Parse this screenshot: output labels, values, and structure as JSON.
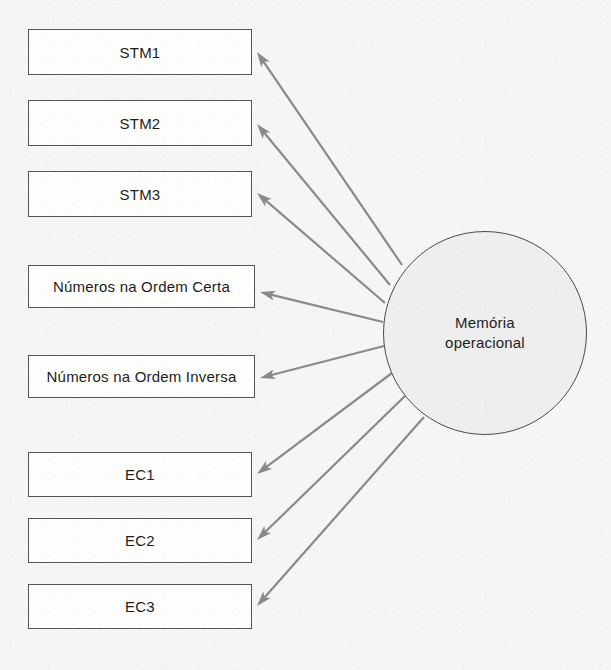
{
  "diagram": {
    "background_color": "#f5f5f4",
    "edge_color": "#8a8a8a",
    "box_border_color": "#545454",
    "box_fill_color": "#fdfdfc",
    "circle_fill_color": "#eeeeee",
    "circle_border_color": "#4a4a4a",
    "text_color": "#1d1d1d"
  },
  "latent": {
    "name": "memoria-operacional",
    "label": "Memória\noperacional",
    "line1": "Memória",
    "line2": "operacional",
    "shape": "circle",
    "cx": 485,
    "cy": 333,
    "r": 102
  },
  "indicators": [
    {
      "id": "stm1",
      "label": "STM1",
      "x": 28,
      "y": 29,
      "w": 224,
      "h": 46
    },
    {
      "id": "stm2",
      "label": "STM2",
      "x": 28,
      "y": 100,
      "w": 224,
      "h": 46
    },
    {
      "id": "stm3",
      "label": "STM3",
      "x": 28,
      "y": 171,
      "w": 224,
      "h": 46
    },
    {
      "id": "ordem-certa",
      "label": "Números na Ordem Certa",
      "x": 28,
      "y": 265,
      "w": 227,
      "h": 43
    },
    {
      "id": "ordem-inversa",
      "label": "Números na Ordem Inversa",
      "x": 28,
      "y": 355,
      "w": 227,
      "h": 43
    },
    {
      "id": "ec1",
      "label": "EC1",
      "x": 28,
      "y": 452,
      "w": 224,
      "h": 45
    },
    {
      "id": "ec2",
      "label": "EC2",
      "x": 28,
      "y": 518,
      "w": 224,
      "h": 45
    },
    {
      "id": "ec3",
      "label": "EC3",
      "x": 28,
      "y": 584,
      "w": 224,
      "h": 45
    }
  ],
  "edges": [
    {
      "from": "memoria-operacional",
      "to": "stm1",
      "arrowhead": "to-indicator",
      "tip_x": 257,
      "tip_y": 52,
      "src_x": 402,
      "src_y": 265
    },
    {
      "from": "memoria-operacional",
      "to": "stm2",
      "arrowhead": "to-indicator",
      "tip_x": 257,
      "tip_y": 124,
      "src_x": 390,
      "src_y": 285
    },
    {
      "from": "memoria-operacional",
      "to": "stm3",
      "arrowhead": "to-indicator",
      "tip_x": 257,
      "tip_y": 193,
      "src_x": 385,
      "src_y": 303
    },
    {
      "from": "memoria-operacional",
      "to": "ordem-certa",
      "arrowhead": "to-indicator",
      "tip_x": 260,
      "tip_y": 292,
      "src_x": 383,
      "src_y": 322
    },
    {
      "from": "memoria-operacional",
      "to": "ordem-inversa",
      "arrowhead": "to-indicator",
      "tip_x": 260,
      "tip_y": 378,
      "src_x": 384,
      "src_y": 346
    },
    {
      "from": "memoria-operacional",
      "to": "ec1",
      "arrowhead": "to-indicator",
      "tip_x": 257,
      "tip_y": 474,
      "src_x": 392,
      "src_y": 373
    },
    {
      "from": "memoria-operacional",
      "to": "ec2",
      "arrowhead": "to-indicator",
      "tip_x": 257,
      "tip_y": 540,
      "src_x": 405,
      "src_y": 396
    },
    {
      "from": "memoria-operacional",
      "to": "ec3",
      "arrowhead": "to-indicator",
      "tip_x": 257,
      "tip_y": 606,
      "src_x": 424,
      "src_y": 417
    }
  ]
}
